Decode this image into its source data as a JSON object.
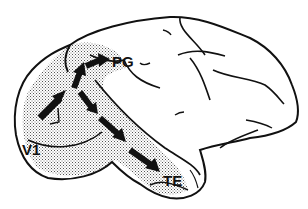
{
  "figure": {
    "colors": {
      "outline": "#111111",
      "stipple": "#9a9a9a",
      "background": "#ffffff"
    },
    "labels": [
      {
        "id": "pg",
        "text": "PG",
        "x": 112,
        "y": 54
      },
      {
        "id": "v1",
        "text": "V1",
        "x": 22,
        "y": 142
      },
      {
        "id": "te",
        "text": "TE",
        "x": 163,
        "y": 173
      }
    ],
    "pathways": [
      {
        "name": "dorsal",
        "from": "V1",
        "to": "PG"
      },
      {
        "name": "ventral",
        "from": "V1",
        "to": "TE"
      }
    ]
  }
}
